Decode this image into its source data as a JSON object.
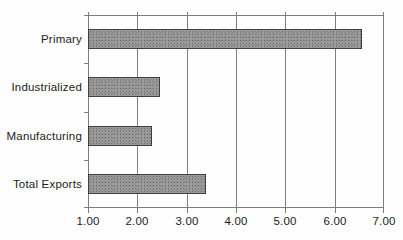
{
  "chart_data": {
    "type": "bar",
    "orientation": "horizontal",
    "title": "",
    "xlabel": "",
    "ylabel": "",
    "categories": [
      "Primary",
      "Industrialized",
      "Manufacturing",
      "Total Exports"
    ],
    "values": [
      6.55,
      2.45,
      2.3,
      3.4
    ],
    "xlim": [
      1.0,
      7.0
    ],
    "xtick_values": [
      1.0,
      2.0,
      3.0,
      4.0,
      5.0,
      6.0,
      7.0
    ],
    "xtick_labels": [
      "1.00",
      "2.00",
      "3.00",
      "4.00",
      "5.00",
      "6.00",
      "7.00"
    ],
    "grid": "vertical gridlines at each major x tick",
    "legend": "none",
    "colors": {
      "background": "#fefefe",
      "bar_fill": "#9a9a9a",
      "bar_speckle": "#6f6f6f",
      "bar_border": "#3f3f3f",
      "axis_line": "#7d7d7d",
      "text": "#1c1c1c"
    }
  }
}
